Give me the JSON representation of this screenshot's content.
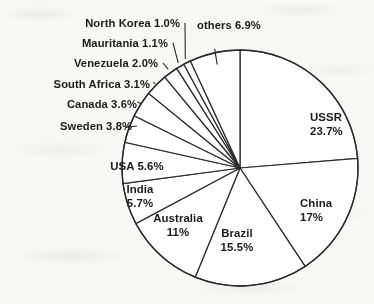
{
  "chart_data": {
    "type": "pie",
    "title": "",
    "units": "percent",
    "start_angle_deg": 0,
    "direction": "clockwise",
    "total": 100.0,
    "categories": [
      "USSR",
      "China",
      "Brazil",
      "Australia",
      "India",
      "USA",
      "Sweden",
      "Canada",
      "South Africa",
      "Venezuela",
      "Mauritania",
      "North Korea",
      "others"
    ],
    "values": [
      23.7,
      17.0,
      15.5,
      11.0,
      5.7,
      5.6,
      3.8,
      3.6,
      3.1,
      2.0,
      1.1,
      1.0,
      6.9
    ],
    "labels": [
      {
        "name": "USSR",
        "value": 23.7,
        "display_name": "USSR",
        "display_value": "23.7%",
        "placement": "inside"
      },
      {
        "name": "China",
        "value": 17.0,
        "display_name": "China",
        "display_value": "17%",
        "placement": "inside"
      },
      {
        "name": "Brazil",
        "value": 15.5,
        "display_name": "Brazil",
        "display_value": "15.5%",
        "placement": "inside"
      },
      {
        "name": "Australia",
        "value": 11.0,
        "display_name": "Australia",
        "display_value": "11%",
        "placement": "inside"
      },
      {
        "name": "India",
        "value": 5.7,
        "display_name": "India",
        "display_value": "5.7%",
        "placement": "inside"
      },
      {
        "name": "USA",
        "value": 5.6,
        "display_name": "USA",
        "display_value": "5.6%",
        "placement": "inside"
      },
      {
        "name": "Sweden",
        "value": 3.8,
        "display_name": "Sweden",
        "display_value": "3.8%",
        "placement": "outside-left"
      },
      {
        "name": "Canada",
        "value": 3.6,
        "display_name": "Canada",
        "display_value": "3.6%",
        "placement": "outside-left"
      },
      {
        "name": "South Africa",
        "value": 3.1,
        "display_name": "South Africa",
        "display_value": "3.1%",
        "placement": "outside-left"
      },
      {
        "name": "Venezuela",
        "value": 2.0,
        "display_name": "Venezuela",
        "display_value": "2.0%",
        "placement": "outside-left"
      },
      {
        "name": "Mauritania",
        "value": 1.1,
        "display_name": "Mauritania",
        "display_value": "1.1%",
        "placement": "outside-left"
      },
      {
        "name": "North Korea",
        "value": 1.0,
        "display_name": "North Korea",
        "display_value": "1.0%",
        "placement": "outside-left"
      },
      {
        "name": "others",
        "value": 6.9,
        "display_name": "others",
        "display_value": "6.9%",
        "placement": "outside-top"
      }
    ],
    "legend": "none",
    "grid": false,
    "colors": {
      "slice_fill": "#ffffff",
      "slice_stroke": "#2b2b2b",
      "label_text": "#1a1a1a",
      "background": "#f7f7f6"
    }
  }
}
